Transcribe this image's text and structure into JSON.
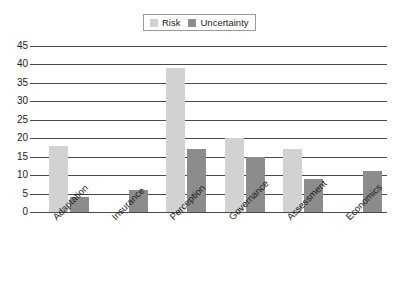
{
  "chart_data": {
    "type": "bar",
    "title": "",
    "xlabel": "",
    "ylabel": "",
    "categories": [
      "Adaptation",
      "Insurance",
      "Perception",
      "Governance",
      "Assessment",
      "Economics"
    ],
    "series": [
      {
        "name": "Risk",
        "color": "#d2d2d2",
        "values": [
          18,
          0,
          39,
          20,
          17,
          0
        ]
      },
      {
        "name": "Uncertainty",
        "color": "#8c8c8c",
        "values": [
          4,
          6,
          17,
          15,
          9,
          11
        ]
      }
    ],
    "ylim": [
      0,
      45
    ],
    "yticks": [
      0,
      5,
      10,
      15,
      20,
      25,
      30,
      35,
      40,
      45
    ],
    "ytick_labels": [
      "0",
      "5",
      "10",
      "15",
      "20",
      "25",
      "30",
      "35",
      "40",
      "45"
    ],
    "grid": true,
    "legend_position": "top-center",
    "axis_color": "#4a4a4a",
    "background": "#ffffff"
  },
  "legend": {
    "entries": [
      {
        "label": "Risk"
      },
      {
        "label": "Uncertainty"
      }
    ]
  }
}
